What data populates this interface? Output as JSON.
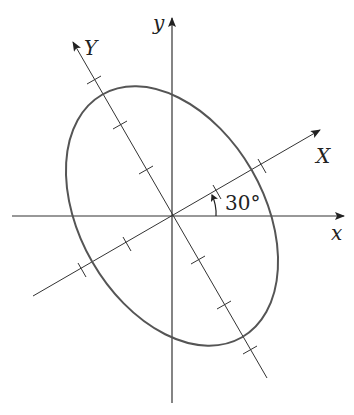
{
  "diagram": {
    "labels": {
      "x_axis": "x",
      "y_axis": "y",
      "X_axis": "X",
      "Y_axis": "Y",
      "angle": "30°"
    },
    "rotation_angle_deg": 30,
    "colors": {
      "axis": "#222222",
      "ellipse": "#555555",
      "background": "#ffffff"
    }
  }
}
